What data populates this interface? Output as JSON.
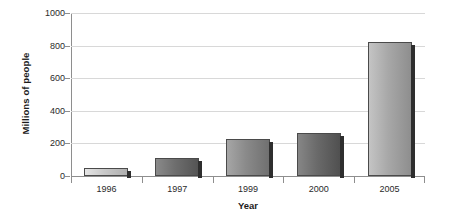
{
  "chart_data": {
    "type": "bar",
    "title": "",
    "categories": [
      "1996",
      "1997",
      "1999",
      "2000",
      "2005"
    ],
    "values": [
      50,
      110,
      225,
      265,
      820
    ],
    "xlabel": "Year",
    "ylabel": "Millions of people",
    "ylim": [
      0,
      1000
    ],
    "yticks": [
      0,
      200,
      400,
      600,
      800,
      1000
    ],
    "ytick_labels": [
      "0",
      "200",
      "400",
      "600",
      "800",
      "1000"
    ],
    "grid": true,
    "legend": "none",
    "bar_colors": [
      "#c9c9c9",
      "#6e6e6e",
      "#8a8a8a",
      "#6a6a6a",
      "#a8a8a8"
    ],
    "bar_edge_color": "#4a4a4a",
    "bar_shadow_color": "#2e2e2e",
    "gridline_color": "#d8d8d8",
    "axis_color": "#8e8e8e",
    "background_color": "#ffffff",
    "text_color": "#1b1b1b"
  }
}
